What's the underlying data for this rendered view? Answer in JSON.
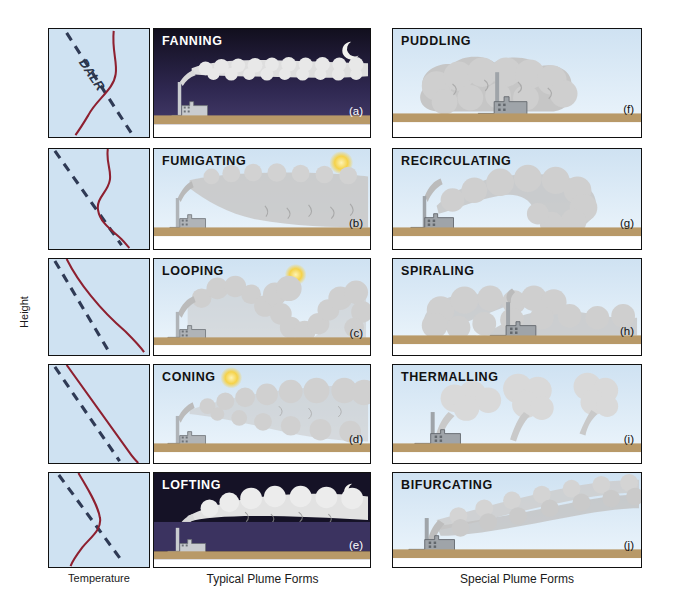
{
  "figure": {
    "axis": {
      "y_label": "Height",
      "x_label": "Temperature"
    },
    "column_captions": {
      "left": "Typical Plume Forms",
      "right": "Special Plume Forms"
    },
    "profile_legend_label": "DALR"
  },
  "colors": {
    "sky_day": "#cfe2f2",
    "sky_night": "#2b2545",
    "ground": "#b89968",
    "plume_gray": "#c6c6c6",
    "plume_white": "#efefef",
    "stack_gray": "#b0b4b8",
    "lapse_line": "#8e2030",
    "dalr_line": "#2f3a55",
    "sun": "#f5d24a",
    "moon": "#f2f2ee",
    "border": "#111111"
  },
  "typical_plumes": [
    {
      "name": "FANNING",
      "letter": "(a)",
      "time_of_day": "night",
      "sky_icon": "moon-icon",
      "title_color": "light",
      "profile": {
        "curve": "inversion-s-curve",
        "dalr_visible": true,
        "dalr_label_visible": true
      }
    },
    {
      "name": "FUMIGATING",
      "letter": "(b)",
      "time_of_day": "day",
      "sky_icon": "sun-icon",
      "title_color": "dark",
      "profile": {
        "curve": "elevated-inversion",
        "dalr_visible": true,
        "dalr_label_visible": false
      }
    },
    {
      "name": "LOOPING",
      "letter": "(c)",
      "time_of_day": "day",
      "sky_icon": "sun-icon",
      "title_color": "dark",
      "profile": {
        "curve": "superadiabatic",
        "dalr_visible": true,
        "dalr_label_visible": false
      }
    },
    {
      "name": "CONING",
      "letter": "(d)",
      "time_of_day": "day",
      "sky_icon": "sun-icon",
      "title_color": "dark",
      "profile": {
        "curve": "near-neutral-parallel",
        "dalr_visible": true,
        "dalr_label_visible": false
      }
    },
    {
      "name": "LOFTING",
      "letter": "(e)",
      "time_of_day": "night",
      "sky_icon": "moon-icon",
      "title_color": "light",
      "profile": {
        "curve": "surface-inversion",
        "dalr_visible": true,
        "dalr_label_visible": false
      }
    }
  ],
  "special_plumes": [
    {
      "name": "PUDDLING",
      "letter": "(f)",
      "time_of_day": "day",
      "sky_icon": "none",
      "title_color": "dark"
    },
    {
      "name": "RECIRCULATING",
      "letter": "(g)",
      "time_of_day": "day",
      "sky_icon": "none",
      "title_color": "dark"
    },
    {
      "name": "SPIRALING",
      "letter": "(h)",
      "time_of_day": "day",
      "sky_icon": "none",
      "title_color": "dark"
    },
    {
      "name": "THERMALLING",
      "letter": "(i)",
      "time_of_day": "day",
      "sky_icon": "none",
      "title_color": "dark"
    },
    {
      "name": "BIFURCATING",
      "letter": "(j)",
      "time_of_day": "day",
      "sky_icon": "none",
      "title_color": "dark"
    }
  ]
}
